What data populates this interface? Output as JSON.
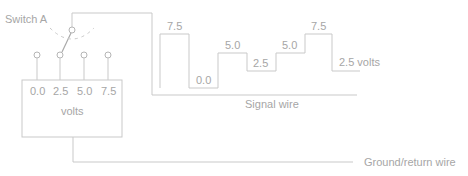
{
  "diagram": {
    "switch_label": "Switch A",
    "box": {
      "terminal_values": [
        "0.0",
        "2.5",
        "5.0",
        "7.5"
      ],
      "unit_label": "volts"
    },
    "signal_wire_label": "Signal wire",
    "ground_wire_label": "Ground/return wire",
    "waveform": {
      "levels": [
        "7.5",
        "0.0",
        "5.0",
        "2.5",
        "5.0",
        "7.5",
        "2.5 volts"
      ]
    },
    "colors": {
      "line": "#c9c9c9",
      "text": "#a6a6a6"
    }
  }
}
